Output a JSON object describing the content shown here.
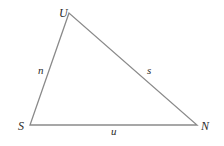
{
  "diagram": {
    "type": "triangle",
    "line_color": "#8a8a8a",
    "text_color": "#2a2a2a",
    "vertices": [
      {
        "label": "U",
        "x": 69,
        "y": 13
      },
      {
        "label": "S",
        "x": 30,
        "y": 125
      },
      {
        "label": "N",
        "x": 197,
        "y": 125
      }
    ],
    "sides": [
      {
        "label": "n",
        "from": "S",
        "to": "U"
      },
      {
        "label": "s",
        "from": "U",
        "to": "N"
      },
      {
        "label": "u",
        "from": "S",
        "to": "N"
      }
    ]
  }
}
